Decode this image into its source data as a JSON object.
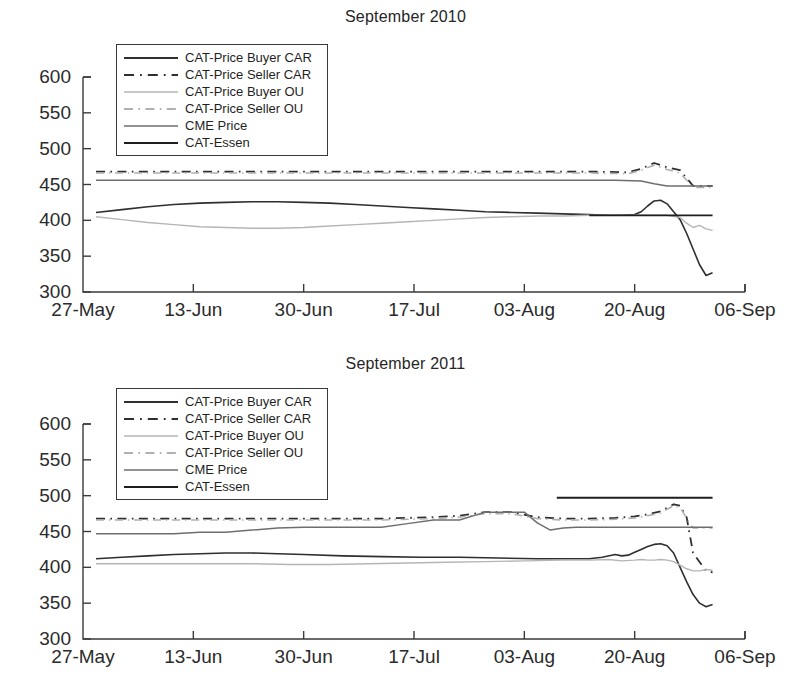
{
  "figure": {
    "panels": [
      "September 2010",
      "September 2011"
    ]
  },
  "chart_data": [
    {
      "type": "line",
      "title": "September 2010",
      "xlabel": "",
      "ylabel": "",
      "xlim": [
        0,
        102
      ],
      "ylim": [
        300,
        600
      ],
      "yticks": [
        300,
        350,
        400,
        450,
        500,
        550,
        600
      ],
      "xticks": [
        0,
        17,
        34,
        51,
        68,
        85,
        102
      ],
      "xtick_labels": [
        "27-May",
        "13-Jun",
        "30-Jun",
        "17-Jul",
        "03-Aug",
        "20-Aug",
        "06-Sep"
      ],
      "grid": false,
      "legend_position": "upper left",
      "series": [
        {
          "name": "CAT-Price Buyer CAR",
          "style": "solid",
          "color": "#2f2f2f",
          "width": 1.6,
          "x": [
            2,
            6,
            10,
            14,
            18,
            22,
            26,
            30,
            34,
            38,
            42,
            46,
            50,
            54,
            58,
            62,
            66,
            70,
            74,
            78,
            81,
            83,
            85,
            86,
            87,
            88,
            89,
            90,
            91,
            92,
            93,
            94,
            95,
            96,
            97
          ],
          "y": [
            411,
            415,
            419,
            422,
            424,
            425,
            426,
            426,
            425,
            424,
            422,
            420,
            418,
            416,
            414,
            412,
            411,
            410,
            409,
            408,
            407,
            407,
            408,
            412,
            420,
            427,
            428,
            423,
            412,
            401,
            382,
            360,
            338,
            323,
            327
          ]
        },
        {
          "name": "CAT-Price Seller CAR",
          "style": "dashdot",
          "color": "#2f2f2f",
          "width": 1.8,
          "x": [
            2,
            12,
            24,
            36,
            48,
            60,
            70,
            78,
            84,
            86,
            88,
            90,
            92,
            94,
            96,
            97
          ],
          "y": [
            468,
            468,
            468,
            468,
            468,
            468,
            468,
            468,
            467,
            472,
            480,
            474,
            470,
            448,
            448,
            448
          ]
        },
        {
          "name": "CAT-Price Buyer OU",
          "style": "solid",
          "color": "#b5b5b5",
          "width": 1.4,
          "x": [
            2,
            6,
            10,
            14,
            18,
            22,
            26,
            30,
            34,
            38,
            42,
            46,
            50,
            54,
            58,
            62,
            66,
            70,
            74,
            78,
            82,
            85,
            88,
            90,
            92,
            93,
            94,
            95,
            96,
            97
          ],
          "y": [
            405,
            401,
            397,
            394,
            391,
            390,
            389,
            389,
            390,
            392,
            394,
            396,
            398,
            400,
            402,
            404,
            405,
            406,
            406,
            407,
            407,
            407,
            407,
            407,
            404,
            396,
            390,
            393,
            388,
            386
          ]
        },
        {
          "name": "CAT-Price Seller OU",
          "style": "dashdot",
          "color": "#b0b0b0",
          "width": 1.6,
          "x": [
            2,
            12,
            24,
            36,
            48,
            60,
            70,
            78,
            84,
            86,
            88,
            90,
            92,
            94,
            96,
            97
          ],
          "y": [
            466,
            466,
            466,
            466,
            466,
            466,
            466,
            466,
            465,
            470,
            477,
            471,
            466,
            446,
            446,
            446
          ]
        },
        {
          "name": "CME Price",
          "style": "solid",
          "color": "#6e6e6e",
          "width": 1.5,
          "x": [
            2,
            20,
            40,
            60,
            75,
            82,
            86,
            88,
            90,
            97
          ],
          "y": [
            456,
            456,
            456,
            456,
            456,
            456,
            455,
            451,
            448,
            448
          ]
        },
        {
          "name": "CAT-Essen",
          "style": "solid",
          "color": "#1f1f1f",
          "width": 1.8,
          "x": [
            78,
            84,
            90,
            97
          ],
          "y": [
            407,
            407,
            407,
            407
          ]
        }
      ]
    },
    {
      "type": "line",
      "title": "September 2011",
      "xlabel": "",
      "ylabel": "",
      "xlim": [
        0,
        102
      ],
      "ylim": [
        300,
        600
      ],
      "yticks": [
        300,
        350,
        400,
        450,
        500,
        550,
        600
      ],
      "xticks": [
        0,
        17,
        34,
        51,
        68,
        85,
        102
      ],
      "xtick_labels": [
        "27-May",
        "13-Jun",
        "30-Jun",
        "17-Jul",
        "03-Aug",
        "20-Aug",
        "06-Sep"
      ],
      "grid": false,
      "legend_position": "upper left",
      "series": [
        {
          "name": "CAT-Price Buyer CAR",
          "style": "solid",
          "color": "#2f2f2f",
          "width": 1.6,
          "x": [
            2,
            6,
            10,
            14,
            18,
            22,
            26,
            30,
            34,
            40,
            46,
            52,
            58,
            64,
            70,
            74,
            78,
            80,
            82,
            83,
            84,
            85,
            86,
            87,
            88,
            89,
            90,
            91,
            92,
            93,
            94,
            95,
            96,
            97
          ],
          "y": [
            412,
            414,
            416,
            418,
            419,
            420,
            420,
            419,
            418,
            416,
            415,
            414,
            414,
            413,
            412,
            412,
            412,
            414,
            418,
            416,
            417,
            421,
            425,
            429,
            432,
            433,
            430,
            420,
            400,
            380,
            362,
            350,
            345,
            348
          ]
        },
        {
          "name": "CAT-Price Seller CAR",
          "style": "dashdot",
          "color": "#2f2f2f",
          "width": 1.8,
          "x": [
            2,
            12,
            24,
            34,
            40,
            46,
            50,
            54,
            58,
            62,
            66,
            70,
            74,
            78,
            82,
            85,
            87,
            89,
            90,
            91,
            92,
            93,
            94,
            96,
            97
          ],
          "y": [
            468,
            468,
            468,
            468,
            468,
            468,
            469,
            470,
            472,
            477,
            477,
            470,
            468,
            468,
            469,
            471,
            474,
            478,
            483,
            488,
            486,
            470,
            420,
            395,
            393
          ]
        },
        {
          "name": "CAT-Price Buyer OU",
          "style": "solid",
          "color": "#b5b5b5",
          "width": 1.4,
          "x": [
            2,
            8,
            14,
            20,
            26,
            32,
            38,
            44,
            50,
            56,
            62,
            68,
            74,
            78,
            81,
            83,
            85,
            86,
            87,
            88,
            89,
            90,
            91,
            92,
            93,
            94,
            95,
            96,
            97
          ],
          "y": [
            405,
            405,
            405,
            405,
            405,
            404,
            404,
            405,
            406,
            407,
            408,
            409,
            410,
            410,
            411,
            409,
            410,
            411,
            410,
            410,
            411,
            410,
            408,
            403,
            398,
            395,
            395,
            397,
            396
          ]
        },
        {
          "name": "CAT-Price Seller OU",
          "style": "dashdot",
          "color": "#b0b0b0",
          "width": 1.6,
          "x": [
            2,
            12,
            24,
            34,
            40,
            46,
            50,
            54,
            58,
            62,
            66,
            70,
            74,
            78,
            82,
            85,
            87,
            89,
            90,
            91,
            92,
            93,
            94,
            96,
            97
          ],
          "y": [
            466,
            466,
            466,
            466,
            466,
            466,
            467,
            468,
            470,
            475,
            475,
            468,
            466,
            466,
            467,
            469,
            472,
            476,
            481,
            486,
            484,
            468,
            455,
            455,
            455
          ]
        },
        {
          "name": "CME Price",
          "style": "solid",
          "color": "#6e6e6e",
          "width": 1.5,
          "x": [
            2,
            14,
            18,
            22,
            26,
            30,
            34,
            40,
            46,
            50,
            54,
            58,
            62,
            66,
            68,
            70,
            72,
            74,
            76,
            78,
            84,
            90,
            97
          ],
          "y": [
            447,
            447,
            449,
            449,
            452,
            455,
            456,
            456,
            456,
            461,
            466,
            466,
            477,
            477,
            477,
            462,
            452,
            455,
            456,
            456,
            456,
            456,
            456
          ]
        },
        {
          "name": "CAT-Essen",
          "style": "solid",
          "color": "#1f1f1f",
          "width": 1.9,
          "x": [
            73,
            82,
            90,
            97
          ],
          "y": [
            497,
            497,
            497,
            497
          ]
        }
      ]
    }
  ],
  "legend": {
    "entries": [
      {
        "label": "CAT-Price Buyer CAR",
        "style": "solid",
        "color": "#2f2f2f",
        "width": 1.8
      },
      {
        "label": "CAT-Price Seller CAR",
        "style": "dashdot",
        "color": "#2f2f2f",
        "width": 2.0
      },
      {
        "label": "CAT-Price Buyer OU",
        "style": "solid",
        "color": "#b5b5b5",
        "width": 1.6
      },
      {
        "label": "CAT-Price Seller OU",
        "style": "dashdot",
        "color": "#b0b0b0",
        "width": 1.8
      },
      {
        "label": "CME Price",
        "style": "solid",
        "color": "#6e6e6e",
        "width": 1.7
      },
      {
        "label": "CAT-Essen",
        "style": "solid",
        "color": "#1f1f1f",
        "width": 2.0
      }
    ]
  }
}
